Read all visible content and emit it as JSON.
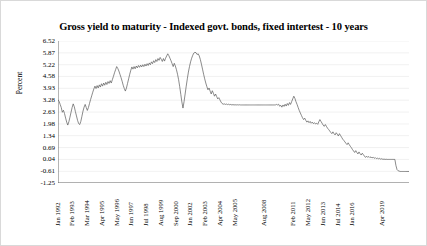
{
  "chart_data": {
    "type": "line",
    "title": "Gross yield to maturity - Indexed govt. bonds, fixed intertest - 10 years",
    "xlabel": "",
    "ylabel": "Percent",
    "ylim": [
      -1.25,
      6.52
    ],
    "grid": true,
    "legend": null,
    "line_color": "#595959",
    "gridline_color": "#e8e8e8",
    "axis_color": "#5a5a5a",
    "yticks": [
      6.52,
      5.87,
      5.22,
      4.58,
      3.93,
      3.28,
      2.63,
      1.98,
      1.34,
      0.69,
      0.04,
      -0.61,
      -1.25
    ],
    "ytick_labels": [
      "6.52",
      "5.87",
      "5.22",
      "4.58",
      "3.93",
      "3.28",
      "2.63",
      "1.98",
      "1.34",
      "0.69",
      "0.04",
      "-0.61",
      "-1.25"
    ],
    "xtick_labels": [
      "Jan 1992",
      "Feb 1993",
      "Mar 1994",
      "Apr 1995",
      "May 1996",
      "Jun 1997",
      "Jul 1998",
      "Aug 1999",
      "Sep 2000",
      "Jan 2002",
      "Feb 2003",
      "Apr 2004",
      "May 2005",
      "Aug 2008",
      "Feb 2011",
      "May 2012",
      "Jun 2013",
      "Jul 2014",
      "Jan 2016",
      "Apr 2019"
    ],
    "xtick_positions": [
      0.0,
      0.042,
      0.084,
      0.126,
      0.168,
      0.21,
      0.252,
      0.294,
      0.336,
      0.378,
      0.42,
      0.462,
      0.504,
      0.588,
      0.672,
      0.714,
      0.756,
      0.798,
      0.84,
      0.924
    ],
    "series": [
      {
        "name": "Gross yield to maturity",
        "values": [
          3.3,
          3.22,
          3.05,
          2.88,
          2.62,
          2.73,
          2.55,
          2.3,
          2.08,
          1.92,
          2.1,
          2.35,
          2.62,
          2.88,
          3.08,
          2.92,
          2.66,
          2.42,
          2.18,
          2.0,
          1.95,
          2.12,
          2.4,
          2.68,
          2.9,
          3.05,
          2.88,
          2.72,
          2.88,
          3.1,
          3.32,
          3.52,
          3.72,
          3.9,
          4.05,
          3.92,
          4.08,
          3.95,
          4.12,
          4.0,
          4.18,
          4.05,
          4.22,
          4.1,
          4.26,
          4.14,
          4.3,
          4.2,
          4.35,
          4.22,
          4.4,
          4.58,
          4.78,
          4.95,
          5.12,
          5.02,
          4.88,
          4.7,
          4.52,
          4.32,
          4.1,
          3.92,
          3.78,
          3.95,
          4.2,
          4.45,
          4.7,
          4.92,
          5.1,
          4.98,
          5.12,
          5.0,
          5.15,
          5.05,
          5.18,
          5.08,
          5.2,
          5.1,
          5.22,
          5.12,
          5.25,
          5.15,
          5.28,
          5.18,
          5.32,
          5.22,
          5.38,
          5.28,
          5.44,
          5.34,
          5.5,
          5.4,
          5.56,
          5.46,
          5.62,
          5.52,
          5.4,
          5.56,
          5.42,
          5.58,
          5.7,
          5.82,
          5.72,
          5.58,
          5.44,
          5.28,
          5.12,
          5.3,
          5.15,
          4.95,
          4.7,
          4.4,
          4.02,
          3.6,
          3.18,
          2.85,
          3.2,
          3.62,
          4.05,
          4.45,
          4.82,
          5.12,
          5.38,
          5.58,
          5.74,
          5.86,
          5.9,
          5.88,
          5.78,
          5.82,
          5.7,
          5.5,
          5.25,
          4.98,
          4.7,
          4.45,
          4.22,
          4.02,
          3.85,
          3.95,
          3.78,
          3.62,
          3.8,
          3.66,
          3.5,
          3.62,
          3.48,
          3.35,
          3.42,
          3.3,
          3.18,
          3.1,
          3.06,
          3.08,
          3.05,
          3.07,
          3.04,
          3.06,
          3.03,
          3.05,
          3.02,
          3.04,
          3.02,
          3.03,
          3.02,
          3.03,
          3.02,
          3.03,
          3.02,
          3.02,
          3.02,
          3.02,
          3.02,
          3.02,
          3.02,
          3.02,
          3.02,
          3.02,
          3.02,
          3.02,
          3.02,
          3.02,
          3.02,
          3.02,
          3.02,
          3.02,
          3.02,
          3.02,
          3.02,
          3.02,
          3.02,
          3.02,
          3.02,
          3.02,
          3.02,
          3.02,
          3.02,
          3.02,
          3.02,
          3.02,
          3.02,
          3.05,
          3.02,
          3.06,
          2.95,
          3.0,
          2.9,
          3.02,
          2.94,
          3.06,
          2.96,
          3.1,
          3.0,
          3.15,
          3.05,
          3.2,
          3.35,
          3.5,
          3.38,
          3.2,
          3.05,
          2.88,
          2.72,
          2.58,
          2.45,
          2.32,
          2.22,
          2.3,
          2.18,
          2.08,
          2.15,
          2.05,
          2.12,
          2.02,
          2.08,
          2.0,
          2.05,
          1.98,
          2.02,
          1.96,
          2.1,
          2.22,
          2.12,
          2.02,
          1.92,
          1.85,
          1.95,
          1.85,
          1.75,
          1.68,
          1.6,
          1.52,
          1.45,
          1.55,
          1.45,
          1.38,
          1.5,
          1.42,
          1.32,
          1.45,
          1.35,
          1.25,
          1.15,
          1.08,
          1.0,
          0.92,
          0.85,
          0.95,
          0.85,
          0.76,
          0.68,
          0.58,
          0.5,
          0.42,
          0.52,
          0.42,
          0.34,
          0.45,
          0.35,
          0.28,
          0.38,
          0.3,
          0.22,
          0.15,
          0.22,
          0.15,
          0.2,
          0.14,
          0.18,
          0.12,
          0.16,
          0.1,
          0.14,
          0.08,
          0.12,
          0.06,
          0.1,
          0.05,
          0.08,
          0.04,
          0.06,
          0.04,
          0.05,
          0.04,
          0.04,
          0.04,
          0.04,
          0.04,
          0.04,
          0.04,
          0.04,
          -0.3,
          -0.52,
          -0.58,
          -0.6,
          -0.62,
          -0.62,
          -0.62,
          -0.62,
          -0.62,
          -0.62,
          -0.62,
          -0.62,
          -0.62
        ]
      }
    ]
  }
}
